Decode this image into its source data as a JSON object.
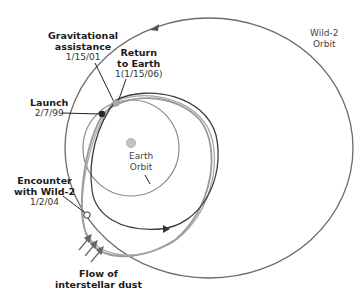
{
  "diagram": {
    "colors": {
      "wild2_orbit": "#6b6b6b",
      "earth_orbit": "#8a8a8a",
      "trajectory_dark": "#3d3d3d",
      "trajectory_light": "#9a9a9a",
      "sun": "#bdbdbd",
      "launch_dot": "#2a2a2a",
      "return_dot": "#a8a8a8",
      "encounter_dot": "#ffffff"
    },
    "labels": {
      "wild2_orbit": {
        "line1": "Wild-2",
        "line2": "Orbit"
      },
      "earth_orbit": {
        "line1": "Earth",
        "line2": "Orbit"
      },
      "gravitational": {
        "title1": "Gravitational",
        "title2": "assistance",
        "date": "1/15/01"
      },
      "return": {
        "title1": "Return",
        "title2": "to Earth",
        "date": "1(1/15/06)"
      },
      "launch": {
        "title": "Launch",
        "date": "2/7/99"
      },
      "encounter": {
        "title1": "Encounter",
        "title2": "with Wild-2",
        "date": "1/2/04"
      },
      "dust": {
        "line1": "Flow of",
        "line2": "interstellar dust"
      }
    },
    "icons": {
      "dust_arrows": "arrow-up-right-icon",
      "orbit_direction": "arrow-left-icon"
    }
  }
}
